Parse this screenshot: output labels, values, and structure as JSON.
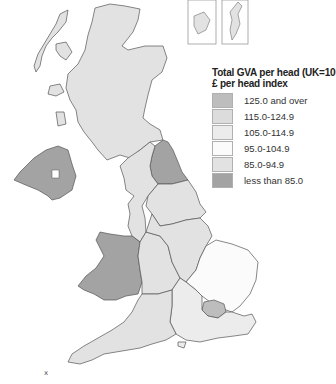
{
  "legend": {
    "title": "Total GVA per head (UK=100)",
    "subtitle": "£ per head index",
    "classes": [
      {
        "label": "125.0 and over",
        "color": "#bdbdbd"
      },
      {
        "label": "115.0-124.9",
        "color": "#dcdcdc"
      },
      {
        "label": "105.0-114.9",
        "color": "#ececec"
      },
      {
        "label": "95.0-104.9",
        "color": "#fbfbfb"
      },
      {
        "label": "85.0-94.9",
        "color": "#e2e2e2"
      },
      {
        "label": "less than 85.0",
        "color": "#a3a3a3"
      }
    ]
  },
  "regions": [
    {
      "name": "Scotland",
      "class": "85.0-94.9",
      "color": "#e2e2e2"
    },
    {
      "name": "Northern Ireland",
      "class": "less than 85.0",
      "color": "#a3a3a3"
    },
    {
      "name": "North East",
      "class": "less than 85.0",
      "color": "#a3a3a3"
    },
    {
      "name": "North West",
      "class": "85.0-94.9",
      "color": "#e2e2e2"
    },
    {
      "name": "Yorkshire and the Humber",
      "class": "85.0-94.9",
      "color": "#e2e2e2"
    },
    {
      "name": "Wales",
      "class": "less than 85.0",
      "color": "#a3a3a3"
    },
    {
      "name": "West Midlands",
      "class": "85.0-94.9",
      "color": "#e2e2e2"
    },
    {
      "name": "East Midlands",
      "class": "85.0-94.9",
      "color": "#e2e2e2"
    },
    {
      "name": "East of England",
      "class": "95.0-104.9",
      "color": "#fbfbfb"
    },
    {
      "name": "London",
      "class": "125.0 and over",
      "color": "#bdbdbd"
    },
    {
      "name": "South East",
      "class": "105.0-114.9",
      "color": "#ececec"
    },
    {
      "name": "South West",
      "class": "85.0-94.9",
      "color": "#e2e2e2"
    }
  ],
  "map_marker": "x"
}
